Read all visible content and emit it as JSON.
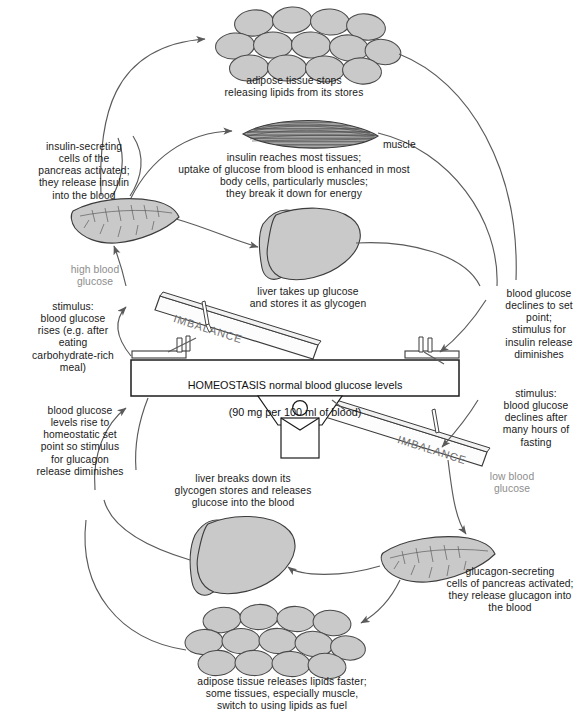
{
  "diagram": {
    "colors": {
      "tissue_fill": "#c9c9c9",
      "tissue_stroke": "#4a4a4a",
      "muscle_fill": "#9a9a9a",
      "line": "#5a5a5a",
      "text": "#1a1a1a",
      "gray_text": "#8d8d8d",
      "beam_fill": "#fdfdfd",
      "beam_stroke": "#3a3a3a"
    },
    "center": {
      "homeostasis_line1": "HOMEOSTASIS normal blood glucose levels",
      "homeostasis_line2": "(90 mg per 100 ml of blood)",
      "imbalance_left": "IMBALANCE",
      "imbalance_right": "IMBALANCE"
    },
    "captions": {
      "adipose_top": "adipose tissue stops\nreleasing lipids from its stores",
      "muscle_label": "muscle",
      "insulin_tissues": "insulin reaches most tissues;\nuptake of glucose from blood is enhanced in most\nbody cells, particularly muscles;\nthey break it down for energy",
      "insulin_pancreas": "insulin-secreting\ncells of the\npancreas activated;\nthey release insulin\ninto the blood",
      "high_blood_glucose": "high blood\nglucose",
      "stimulus_rise": "stimulus:\nblood glucose\nrises (e.g. after\neating\ncarbohydrate-rich\nmeal)",
      "liver_uptake": "liver takes up glucose\nand stores it as glycogen",
      "decline_to_set_point": "blood glucose\ndeclines to set\npoint;\nstimulus for\ninsulin release\ndiminishes",
      "stimulus_decline": "stimulus:\nblood glucose\ndeclines after\nmany hours of\nfasting",
      "low_blood_glucose": "low blood\nglucose",
      "glucagon_pancreas": "glucagon-secreting\ncells of pancreas activated;\nthey release glucagon into\nthe blood",
      "liver_breakdown": "liver breaks down its\nglycogen stores and releases\nglucose into the blood",
      "glucose_rise_set_point": "blood glucose\nlevels rise to\nhomeostatic set\npoint so stimulus\nfor glucagon\nrelease diminishes",
      "adipose_bottom": "adipose tissue releases lipids faster;\nsome tissues, especially muscle,\nswitch to using lipids as fuel"
    }
  }
}
